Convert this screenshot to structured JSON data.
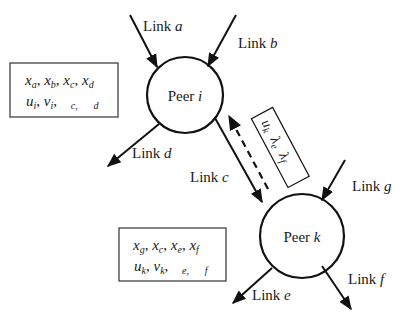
{
  "diagram": {
    "peers": [
      {
        "id": "i",
        "prefix": "Peer ",
        "var": "i"
      },
      {
        "id": "k",
        "prefix": "Peer ",
        "var": "k"
      }
    ],
    "links": {
      "a": {
        "prefix": "Link ",
        "var": "a"
      },
      "b": {
        "prefix": "Link ",
        "var": "b"
      },
      "c": {
        "prefix": "Link ",
        "var": "c"
      },
      "d": {
        "prefix": "Link ",
        "var": "d"
      },
      "e": {
        "prefix": "Link ",
        "var": "e"
      },
      "f": {
        "prefix": "Link ",
        "var": "f"
      },
      "g": {
        "prefix": "Link ",
        "var": "g"
      }
    },
    "box_i": {
      "row1": [
        {
          "base": "x",
          "sub": "a"
        },
        {
          "base": "x",
          "sub": "b"
        },
        {
          "base": "x",
          "sub": "c"
        },
        {
          "base": "x",
          "sub": "d"
        }
      ],
      "row2": [
        {
          "base": "u",
          "sub": "i"
        },
        {
          "base": "v",
          "sub": "i"
        },
        {
          "base": "",
          "sub": "c"
        },
        {
          "base": "",
          "sub": "d"
        }
      ]
    },
    "box_k": {
      "row1": [
        {
          "base": "x",
          "sub": "g"
        },
        {
          "base": "x",
          "sub": "c"
        },
        {
          "base": "x",
          "sub": "e"
        },
        {
          "base": "x",
          "sub": "f"
        }
      ],
      "row2": [
        {
          "base": "u",
          "sub": "k"
        },
        {
          "base": "v",
          "sub": "k"
        },
        {
          "base": "",
          "sub": "e"
        },
        {
          "base": "",
          "sub": "f"
        }
      ]
    },
    "message_box": {
      "items": [
        {
          "base": "u",
          "sub": "k"
        },
        {
          "base": "λ",
          "sub": "e"
        },
        {
          "base": "λ",
          "sub": "f"
        }
      ]
    },
    "separator": ", ",
    "stroke_color": "#111111"
  }
}
